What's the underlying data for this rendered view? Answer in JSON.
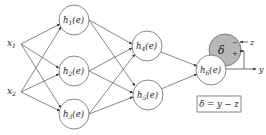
{
  "diagram": {
    "type": "neural-network",
    "inputs": [
      {
        "id": "x1",
        "label": "x",
        "sub": "1",
        "x": 13,
        "y": 44
      },
      {
        "id": "x2",
        "label": "x",
        "sub": "2",
        "x": 13,
        "y": 92
      }
    ],
    "hidden_layer_1": [
      {
        "id": "h1",
        "label": "h",
        "sub": "1",
        "arg": "(e)",
        "cx": 74,
        "cy": 20
      },
      {
        "id": "h2",
        "label": "h",
        "sub": "2",
        "arg": "(e)",
        "cx": 74,
        "cy": 71
      },
      {
        "id": "h3",
        "label": "h",
        "sub": "3",
        "arg": "(e)",
        "cx": 74,
        "cy": 114
      }
    ],
    "hidden_layer_2": [
      {
        "id": "h4",
        "label": "h",
        "sub": "4",
        "arg": "(e)",
        "cx": 147,
        "cy": 46
      },
      {
        "id": "h5",
        "label": "h",
        "sub": "5",
        "arg": "(e)",
        "cx": 148,
        "cy": 95
      }
    ],
    "output": {
      "id": "h6",
      "label": "h",
      "sub": "6",
      "arg": "(e)",
      "cx": 211,
      "cy": 70
    },
    "error_node": {
      "label": "δ",
      "minus": "−",
      "plus": "+",
      "cx": 225,
      "cy": 50,
      "fill": "#b8b8b8"
    },
    "target_label": "z",
    "output_label": "y",
    "formula": "δ = y − z",
    "node_radius": 15,
    "line_color": "#555555"
  }
}
